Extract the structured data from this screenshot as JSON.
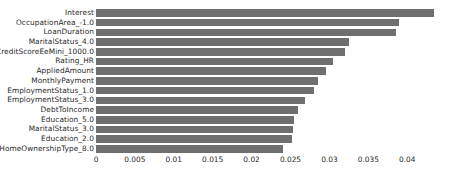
{
  "chart_data": {
    "type": "bar",
    "orientation": "horizontal",
    "title": "",
    "xlabel": "",
    "ylabel": "",
    "xlim": [
      0,
      0.0455
    ],
    "xticks": [
      0,
      0.005,
      0.01,
      0.015,
      0.02,
      0.025,
      0.03,
      0.035,
      0.04
    ],
    "xtick_labels": [
      "0",
      "0.005",
      "0.01",
      "0.015",
      "0.02",
      "0.025",
      "0.03",
      "0.035",
      "0.04"
    ],
    "grid": false,
    "legend": null,
    "bar_color": "#6f6f6f",
    "background_color": "#ffffff",
    "categories": [
      "Interest",
      "OccupationArea_-1.0",
      "LoanDuration",
      "MaritalStatus_4.0",
      "CreditScoreEeMini_1000.0",
      "Rating_HR",
      "AppliedAmount",
      "MonthlyPayment",
      "EmploymentStatus_1.0",
      "EmploymentStatus_3.0",
      "DebtToIncome",
      "Education_5.0",
      "MaritalStatus_3.0",
      "Education_2.0",
      "HomeOwnershipType_8.0"
    ],
    "values": [
      0.0435,
      0.039,
      0.0385,
      0.0325,
      0.032,
      0.0305,
      0.0295,
      0.0285,
      0.028,
      0.0268,
      0.026,
      0.0255,
      0.0253,
      0.0252,
      0.024
    ]
  }
}
